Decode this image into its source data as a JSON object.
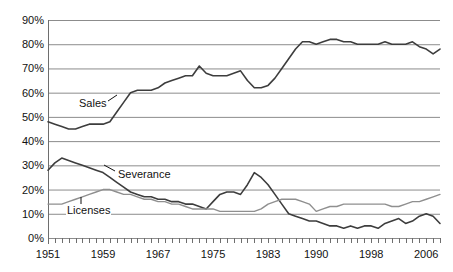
{
  "chart_data": {
    "type": "line",
    "title": "",
    "subtitle": "",
    "xlabel": "",
    "ylabel": "",
    "ylim": [
      0,
      90
    ],
    "ytick_values": [
      0,
      10,
      20,
      30,
      40,
      50,
      60,
      70,
      80,
      90
    ],
    "ytick_labels": [
      "0%",
      "10%",
      "20%",
      "30%",
      "40%",
      "50%",
      "60%",
      "70%",
      "80%",
      "90%"
    ],
    "xlim": [
      1951,
      2008
    ],
    "xtick_labels": [
      "1951",
      "1959",
      "1967",
      "1975",
      "1983",
      "1990",
      "1998",
      "2006"
    ],
    "xtick_values": [
      1951,
      1959,
      1967,
      1975,
      1983,
      1990,
      1998,
      2006
    ],
    "x_minor_ticks_every": 1,
    "grid": "horizontal",
    "legend": "inline-labels",
    "annotations": [
      {
        "text": "Sales",
        "x": 1956,
        "y": 55
      },
      {
        "text": "Severance",
        "x": 1962,
        "y": 25
      },
      {
        "text": "Licenses",
        "x": 1955,
        "y": 12
      }
    ],
    "x": [
      1951,
      1952,
      1953,
      1954,
      1955,
      1956,
      1957,
      1958,
      1959,
      1960,
      1961,
      1962,
      1963,
      1964,
      1965,
      1966,
      1967,
      1968,
      1969,
      1970,
      1971,
      1972,
      1973,
      1974,
      1975,
      1976,
      1977,
      1978,
      1979,
      1980,
      1981,
      1982,
      1983,
      1984,
      1985,
      1986,
      1987,
      1988,
      1989,
      1990,
      1991,
      1992,
      1993,
      1994,
      1995,
      1996,
      1997,
      1998,
      1999,
      2000,
      2001,
      2002,
      2003,
      2004,
      2005,
      2006,
      2007,
      2008
    ],
    "series": [
      {
        "name": "Sales",
        "color": "#3d3d3d",
        "values": [
          48,
          47,
          46,
          45,
          45,
          46,
          47,
          47,
          47,
          48,
          52,
          56,
          60,
          61,
          61,
          61,
          62,
          64,
          65,
          66,
          67,
          67,
          71,
          68,
          67,
          67,
          67,
          68,
          69,
          65,
          62,
          62,
          63,
          66,
          70,
          74,
          78,
          81,
          81,
          80,
          81,
          82,
          82,
          81,
          81,
          80,
          80,
          80,
          80,
          81,
          80,
          80,
          80,
          81,
          79,
          78,
          76,
          78
        ]
      },
      {
        "name": "Severance",
        "color": "#3d3d3d",
        "values": [
          28,
          31,
          33,
          32,
          31,
          30,
          29,
          28,
          27,
          25,
          23,
          21,
          19,
          18,
          17,
          17,
          16,
          16,
          15,
          15,
          14,
          14,
          13,
          12,
          15,
          18,
          19,
          19,
          18,
          22,
          27,
          25,
          22,
          18,
          14,
          10,
          9,
          8,
          7,
          7,
          6,
          5,
          5,
          4,
          5,
          4,
          5,
          5,
          4,
          6,
          7,
          8,
          6,
          7,
          9,
          10,
          9,
          6
        ]
      },
      {
        "name": "Licenses",
        "color": "#8f8f8f",
        "values": [
          14,
          14,
          14,
          15,
          16,
          17,
          18,
          19,
          20,
          20,
          19,
          18,
          18,
          17,
          16,
          16,
          15,
          15,
          14,
          14,
          13,
          12,
          12,
          12,
          12,
          11,
          11,
          11,
          11,
          11,
          11,
          12,
          14,
          15,
          16,
          16,
          16,
          15,
          14,
          11,
          12,
          13,
          13,
          14,
          14,
          14,
          14,
          14,
          14,
          14,
          13,
          13,
          14,
          15,
          15,
          16,
          17,
          18
        ]
      }
    ]
  },
  "axes": {
    "y_labels": [
      "90%",
      "80%",
      "70%",
      "60%",
      "50%",
      "40%",
      "30%",
      "20%",
      "10%",
      "0%"
    ],
    "x_labels": [
      "1951",
      "1959",
      "1967",
      "1975",
      "1983",
      "1990",
      "1998",
      "2006"
    ]
  },
  "labels": {
    "sales": "Sales",
    "severance": "Severance",
    "licenses": "Licenses"
  },
  "colors": {
    "sales_line": "#3d3d3d",
    "severance_line": "#3d3d3d",
    "licenses_line": "#8f8f8f",
    "gridline": "#8c8c8c",
    "axis": "#6e6e6e",
    "text": "#111111",
    "background": "#ffffff"
  }
}
